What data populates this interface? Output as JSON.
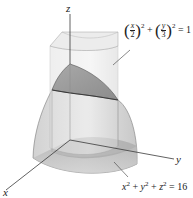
{
  "diagram": {
    "type": "3d-solid-region",
    "axes": {
      "x_label": "x",
      "y_label": "y",
      "z_label": "z"
    },
    "labels": {
      "cylinder_equation": "(x/2)^2 + (y/3)^2 = 1",
      "cylinder_x_num": "x",
      "cylinder_x_den": "2",
      "cylinder_y_num": "y",
      "cylinder_y_den": "3",
      "cylinder_exp": "2",
      "cylinder_rhs": "= 1",
      "sphere_equation": "x^2 + y^2 + z^2 = 16",
      "sphere_rhs": "= 16"
    },
    "colors": {
      "surface_light": "#e6e6e6",
      "surface_mid": "#c4c4c4",
      "surface_dark": "#9e9e9e",
      "line": "#3a3a3a",
      "background": "#ffffff"
    }
  }
}
